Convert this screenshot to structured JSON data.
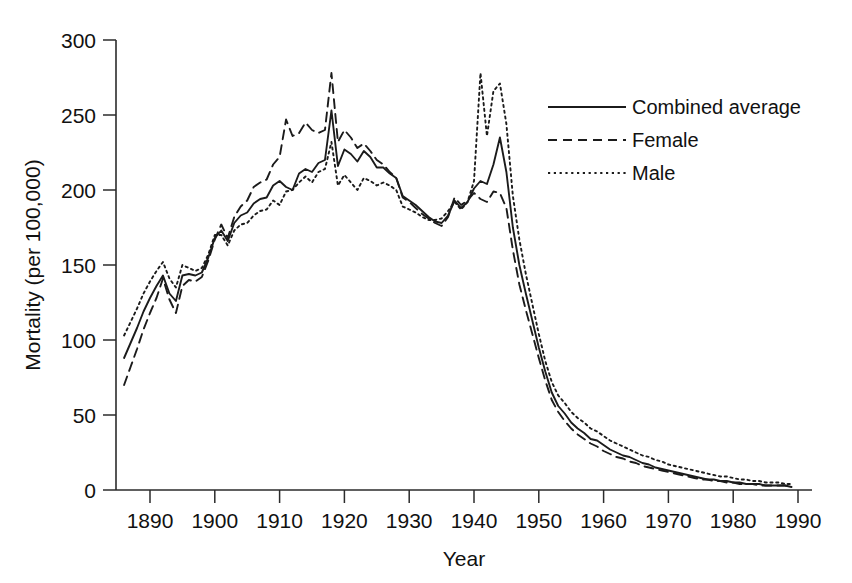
{
  "chart_data": {
    "type": "line",
    "title": "",
    "xlabel": "Year",
    "ylabel": "Mortality (per 100,000)",
    "xlim": [
      1886,
      1990
    ],
    "ylim": [
      0,
      300
    ],
    "xticks": [
      1890,
      1900,
      1910,
      1920,
      1930,
      1940,
      1950,
      1960,
      1970,
      1980,
      1990
    ],
    "xtick_labels": [
      "1890",
      "1900",
      "1910",
      "1920",
      "1930",
      "1940",
      "1950",
      "1960",
      "1970",
      "1980",
      "1990"
    ],
    "yticks": [
      0,
      50,
      100,
      150,
      200,
      250,
      300
    ],
    "ytick_labels": [
      "0",
      "50",
      "100",
      "150",
      "200",
      "250",
      "300"
    ],
    "grid": false,
    "legend_position": "top-right",
    "x": [
      1886,
      1887,
      1888,
      1889,
      1890,
      1891,
      1892,
      1893,
      1894,
      1895,
      1896,
      1897,
      1898,
      1899,
      1900,
      1901,
      1902,
      1903,
      1904,
      1905,
      1906,
      1907,
      1908,
      1909,
      1910,
      1911,
      1912,
      1913,
      1914,
      1915,
      1916,
      1917,
      1918,
      1919,
      1920,
      1921,
      1922,
      1923,
      1924,
      1925,
      1926,
      1927,
      1928,
      1929,
      1930,
      1931,
      1932,
      1933,
      1934,
      1935,
      1936,
      1937,
      1938,
      1939,
      1940,
      1941,
      1942,
      1943,
      1944,
      1945,
      1946,
      1947,
      1948,
      1949,
      1950,
      1951,
      1952,
      1953,
      1954,
      1955,
      1956,
      1957,
      1958,
      1959,
      1960,
      1961,
      1962,
      1963,
      1964,
      1965,
      1966,
      1967,
      1968,
      1969,
      1970,
      1971,
      1972,
      1973,
      1974,
      1975,
      1976,
      1977,
      1978,
      1979,
      1980,
      1981,
      1982,
      1983,
      1984,
      1985,
      1986,
      1987,
      1988,
      1989
    ],
    "series": [
      {
        "name": "Combined average",
        "style": "solid",
        "values": [
          88,
          98,
          108,
          119,
          128,
          136,
          143,
          131,
          126,
          143,
          144,
          143,
          145,
          155,
          168,
          173,
          166,
          178,
          183,
          185,
          191,
          194,
          195,
          203,
          206,
          202,
          200,
          211,
          214,
          212,
          218,
          220,
          253,
          216,
          227,
          224,
          219,
          226,
          222,
          215,
          215,
          211,
          208,
          196,
          193,
          190,
          186,
          182,
          179,
          178,
          183,
          193,
          188,
          192,
          201,
          206,
          204,
          217,
          235,
          212,
          175,
          150,
          131,
          113,
          95,
          79,
          65,
          56,
          51,
          45,
          41,
          38,
          34,
          33,
          30,
          27,
          25,
          23,
          22,
          20,
          18,
          17,
          15,
          14,
          13,
          12,
          11,
          10,
          9,
          8,
          7,
          7,
          6,
          6,
          5,
          5,
          4,
          4,
          4,
          3,
          3,
          3,
          3,
          2
        ]
      },
      {
        "name": "Female",
        "style": "dashed",
        "values": [
          70,
          82,
          94,
          107,
          118,
          128,
          141,
          127,
          118,
          136,
          140,
          139,
          142,
          153,
          167,
          177,
          168,
          182,
          189,
          193,
          202,
          205,
          207,
          217,
          222,
          247,
          236,
          238,
          245,
          240,
          238,
          240,
          278,
          232,
          240,
          235,
          228,
          231,
          226,
          220,
          217,
          212,
          208,
          195,
          192,
          188,
          184,
          181,
          178,
          176,
          182,
          195,
          190,
          193,
          198,
          194,
          192,
          199,
          198,
          188,
          160,
          137,
          120,
          104,
          88,
          73,
          60,
          52,
          46,
          41,
          37,
          34,
          31,
          29,
          26,
          24,
          22,
          21,
          19,
          18,
          16,
          15,
          14,
          13,
          12,
          11,
          10,
          9,
          8,
          7,
          7,
          6,
          6,
          5,
          5,
          4,
          4,
          4,
          3,
          3,
          3,
          3,
          3,
          2
        ]
      },
      {
        "name": "Male",
        "style": "dotted",
        "values": [
          103,
          112,
          121,
          131,
          139,
          146,
          152,
          141,
          135,
          150,
          148,
          146,
          148,
          157,
          170,
          170,
          163,
          173,
          177,
          178,
          183,
          186,
          187,
          193,
          190,
          199,
          200,
          205,
          209,
          205,
          212,
          214,
          232,
          203,
          210,
          205,
          200,
          208,
          206,
          203,
          205,
          203,
          200,
          189,
          187,
          185,
          182,
          180,
          180,
          181,
          186,
          192,
          187,
          192,
          206,
          278,
          236,
          266,
          271,
          244,
          196,
          167,
          144,
          124,
          104,
          86,
          72,
          63,
          58,
          52,
          48,
          45,
          41,
          39,
          36,
          33,
          31,
          29,
          27,
          25,
          23,
          22,
          20,
          19,
          17,
          16,
          15,
          14,
          13,
          12,
          11,
          10,
          9,
          9,
          8,
          7,
          7,
          6,
          6,
          5,
          5,
          5,
          4,
          4
        ]
      }
    ]
  },
  "legend": {
    "items": [
      {
        "label": "Combined average",
        "style": "solid"
      },
      {
        "label": "Female",
        "style": "dashed"
      },
      {
        "label": "Male",
        "style": "dotted"
      }
    ]
  }
}
